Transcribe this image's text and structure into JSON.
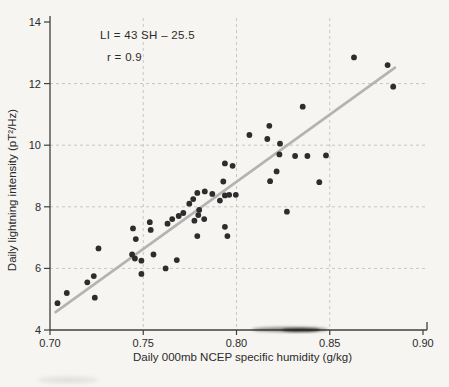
{
  "figure": {
    "background": "#f6f5f1",
    "annotation_line1": "LI = 43 SH – 25.5",
    "annotation_line2": "r = 0.9",
    "colors": {
      "point": "#2d2d2d",
      "regression_line": "#b3b3b3",
      "grid": "#c6c6c2",
      "axis": "#3f3f3f",
      "text": "#2b2b2b"
    }
  },
  "chart_data": {
    "type": "scatter",
    "title": "",
    "xlabel": "Daily 000mb NCEP specific humidity (g/kg)",
    "ylabel": "Daily lightning intensity (pT²/Hz)",
    "xlim": [
      0.7,
      0.9
    ],
    "ylim": [
      4,
      14
    ],
    "xticks": [
      0.7,
      0.75,
      0.8,
      0.85,
      0.9
    ],
    "xtick_labels": [
      "0.70",
      "0.75",
      "0.80",
      "0.85",
      "0.90"
    ],
    "yticks": [
      4,
      6,
      8,
      10,
      12,
      14
    ],
    "ytick_labels": [
      "4",
      "6",
      "8",
      "10",
      "12",
      "14"
    ],
    "grid": true,
    "grid_style": "dashed",
    "legend": null,
    "annotations": [
      "LI = 43 SH – 25.5",
      "r = 0.9"
    ],
    "regression": {
      "equation": "LI = 43 SH - 25.5",
      "r": 0.9,
      "x1": 0.703,
      "y1": 4.58,
      "x2": 0.885,
      "y2": 12.52
    },
    "points": [
      [
        0.704,
        4.87
      ],
      [
        0.709,
        5.2
      ],
      [
        0.72,
        5.55
      ],
      [
        0.7235,
        5.75
      ],
      [
        0.724,
        5.05
      ],
      [
        0.726,
        6.65
      ],
      [
        0.7445,
        7.3
      ],
      [
        0.746,
        6.95
      ],
      [
        0.744,
        6.45
      ],
      [
        0.7455,
        6.32
      ],
      [
        0.749,
        6.25
      ],
      [
        0.749,
        5.82
      ],
      [
        0.7555,
        6.45
      ],
      [
        0.7535,
        7.5
      ],
      [
        0.754,
        7.25
      ],
      [
        0.762,
        6.0
      ],
      [
        0.768,
        6.27
      ],
      [
        0.763,
        7.45
      ],
      [
        0.7655,
        7.6
      ],
      [
        0.7715,
        7.8
      ],
      [
        0.769,
        7.7
      ],
      [
        0.7747,
        8.1
      ],
      [
        0.7768,
        8.25
      ],
      [
        0.7774,
        7.55
      ],
      [
        0.7795,
        7.73
      ],
      [
        0.78,
        7.9
      ],
      [
        0.7827,
        7.6
      ],
      [
        0.779,
        7.05
      ],
      [
        0.7951,
        7.05
      ],
      [
        0.7938,
        7.35
      ],
      [
        0.779,
        8.45
      ],
      [
        0.783,
        8.5
      ],
      [
        0.787,
        8.42
      ],
      [
        0.7911,
        8.2
      ],
      [
        0.7938,
        8.37
      ],
      [
        0.7961,
        8.39
      ],
      [
        0.7996,
        8.39
      ],
      [
        0.7929,
        8.82
      ],
      [
        0.7938,
        9.41
      ],
      [
        0.7979,
        9.33
      ],
      [
        0.8069,
        10.33
      ],
      [
        0.8165,
        10.2
      ],
      [
        0.8176,
        10.63
      ],
      [
        0.818,
        8.83
      ],
      [
        0.8215,
        9.15
      ],
      [
        0.823,
        9.7
      ],
      [
        0.8233,
        10.05
      ],
      [
        0.827,
        7.84
      ],
      [
        0.8314,
        9.65
      ],
      [
        0.8355,
        11.25
      ],
      [
        0.838,
        9.65
      ],
      [
        0.8444,
        8.8
      ],
      [
        0.848,
        9.67
      ],
      [
        0.863,
        12.85
      ],
      [
        0.881,
        12.6
      ],
      [
        0.884,
        11.9
      ]
    ]
  }
}
